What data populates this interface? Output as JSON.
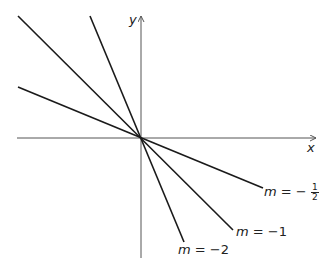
{
  "chart_data": {
    "type": "line",
    "title": "",
    "xlabel": "x",
    "ylabel": "y",
    "grid": false,
    "origin_px": [
      141,
      138
    ],
    "series": [
      {
        "name": "m = -1/2",
        "slope": -0.5,
        "label_parts": {
          "var": "m",
          "eq": "= −",
          "num": "1",
          "den": "2"
        }
      },
      {
        "name": "m = -1",
        "slope": -1,
        "label_parts": {
          "var": "m",
          "eq": "= −1"
        }
      },
      {
        "name": "m = -2",
        "slope": -2,
        "label_parts": {
          "var": "m",
          "eq": "= −2"
        }
      }
    ],
    "lines_px": [
      {
        "slope": -0.5,
        "x1": 18,
        "y1": 87,
        "x2": 263,
        "y2": 188
      },
      {
        "slope": -1,
        "x1": 18,
        "y1": 16,
        "x2": 233,
        "y2": 230
      },
      {
        "slope": -2,
        "x1": 90,
        "y1": 16,
        "x2": 184,
        "y2": 242
      }
    ],
    "axes": {
      "x_label": "x",
      "y_label": "y"
    }
  },
  "colors": {
    "line": "#1a1a1a",
    "axis": "#555555"
  }
}
